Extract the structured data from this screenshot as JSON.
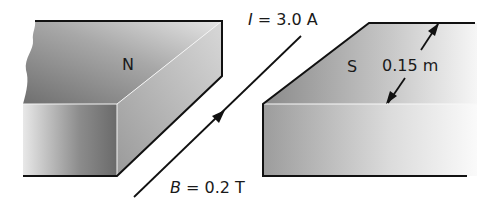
{
  "diagram": {
    "north_pole": {
      "label": "N"
    },
    "south_pole": {
      "label": "S"
    },
    "current": {
      "symbol": "I",
      "equals": " = 3.0 A"
    },
    "field": {
      "symbol": "B",
      "equals": " = 0.2 T"
    },
    "gap_width": {
      "label": "0.15 m"
    }
  },
  "colors": {
    "stroke": "#111111",
    "magnet_dark": "#7a7a7a",
    "magnet_mid": "#b5b5b5",
    "magnet_light": "#efefef"
  }
}
